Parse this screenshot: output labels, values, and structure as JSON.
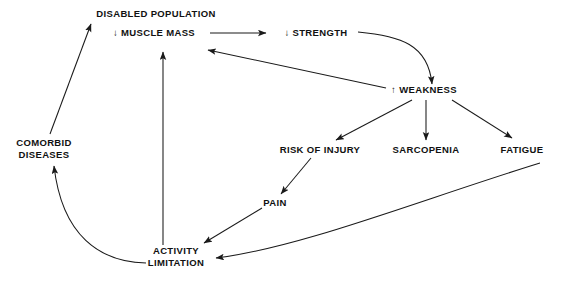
{
  "diagram": {
    "background_color": "#ffffff",
    "line_color": "#1a1a1a",
    "text_color": "#111111",
    "nodes": [
      {
        "id": "disabled_population",
        "label": "DISABLED POPULATION",
        "x": 156,
        "y": 14,
        "anchor": "middle"
      },
      {
        "id": "muscle_mass",
        "label": "↓ MUSCLE MASS",
        "x": 154,
        "y": 33,
        "anchor": "middle"
      },
      {
        "id": "strength",
        "label": "↓ STRENGTH",
        "x": 316,
        "y": 33,
        "anchor": "middle"
      },
      {
        "id": "weakness",
        "label": "↑ WEAKNESS",
        "x": 424,
        "y": 90,
        "anchor": "middle"
      },
      {
        "id": "comorbid_diseases_line1",
        "label": "COMORBID",
        "x": 44,
        "y": 143,
        "anchor": "middle"
      },
      {
        "id": "comorbid_diseases_line2",
        "label": "DISEASES",
        "x": 44,
        "y": 155,
        "anchor": "middle"
      },
      {
        "id": "risk_of_injury",
        "label": "RISK OF INJURY",
        "x": 320,
        "y": 150,
        "anchor": "middle"
      },
      {
        "id": "sarcopenia",
        "label": "SARCOPENIA",
        "x": 426,
        "y": 150,
        "anchor": "middle"
      },
      {
        "id": "fatigue",
        "label": "FATIGUE",
        "x": 522,
        "y": 150,
        "anchor": "middle"
      },
      {
        "id": "pain",
        "label": "PAIN",
        "x": 275,
        "y": 203,
        "anchor": "middle"
      },
      {
        "id": "activity_limitation_line1",
        "label": "ACTIVITY",
        "x": 176,
        "y": 251,
        "anchor": "middle"
      },
      {
        "id": "activity_limitation_line2",
        "label": "LIMITATION",
        "x": 176,
        "y": 263,
        "anchor": "middle"
      }
    ],
    "edges": [
      {
        "id": "muscle-mass-to-strength",
        "from": "muscle_mass",
        "to": "strength",
        "path": "M 210 33 L 266 33",
        "style": "straight"
      },
      {
        "id": "strength-to-weakness",
        "from": "strength",
        "to": "weakness",
        "path": "M 358 32 C 400 36 428 44 432 84",
        "style": "curved"
      },
      {
        "id": "weakness-to-muscle-mass",
        "from": "weakness",
        "to": "muscle_mass",
        "path": "M 386 88 L 208 50",
        "style": "straight"
      },
      {
        "id": "weakness-to-risk-of-injury",
        "from": "weakness",
        "to": "risk_of_injury",
        "path": "M 412 100 L 336 140",
        "style": "straight"
      },
      {
        "id": "weakness-to-sarcopenia",
        "from": "weakness",
        "to": "sarcopenia",
        "path": "M 426 100 L 426 140",
        "style": "straight"
      },
      {
        "id": "weakness-to-fatigue",
        "from": "weakness",
        "to": "fatigue",
        "path": "M 452 100 L 512 138",
        "style": "straight"
      },
      {
        "id": "risk-of-injury-to-pain",
        "from": "risk_of_injury",
        "to": "pain",
        "path": "M 311 158 L 281 194",
        "style": "straight"
      },
      {
        "id": "pain-to-activity-limitation",
        "from": "pain",
        "to": "activity_limitation",
        "path": "M 262 208 L 204 243",
        "style": "straight"
      },
      {
        "id": "fatigue-to-activity-limitation",
        "from": "fatigue",
        "to": "activity_limitation",
        "path": "M 540 163 C 420 200 300 248 216 258",
        "style": "curved"
      },
      {
        "id": "activity-limitation-to-muscle-mass",
        "from": "activity_limitation",
        "to": "muscle_mass",
        "path": "M 163 245 L 163 52",
        "style": "straight"
      },
      {
        "id": "activity-limitation-to-comorbid-diseases",
        "from": "activity_limitation",
        "to": "comorbid_diseases",
        "path": "M 146 263 C 100 262 62 236 54 166",
        "style": "curved"
      },
      {
        "id": "comorbid-diseases-to-disabled-population",
        "from": "comorbid_diseases",
        "to": "disabled_population",
        "path": "M 50 134 L 91 24",
        "style": "straight"
      }
    ]
  }
}
